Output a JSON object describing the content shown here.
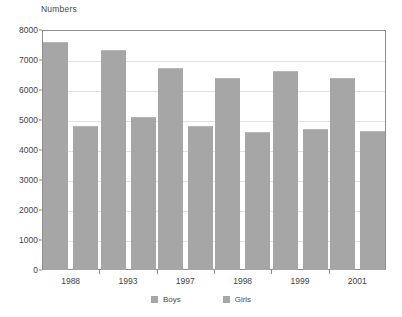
{
  "chart_data": {
    "type": "bar",
    "title": "",
    "ylabel": "Numbers",
    "xlabel": "",
    "categories": [
      "1988",
      "1993",
      "1997",
      "1998",
      "1999",
      "2001"
    ],
    "series": [
      {
        "name": "Boys",
        "color": "#a6a6a6",
        "values": [
          7600,
          7350,
          6750,
          6400,
          6650,
          6400
        ]
      },
      {
        "name": "Girls",
        "color": "#a6a6a6",
        "values": [
          4800,
          5100,
          4800,
          4600,
          4700,
          4650
        ]
      }
    ],
    "ylim": [
      0,
      8000
    ],
    "ytick_values": [
      0,
      1000,
      2000,
      3000,
      4000,
      5000,
      6000,
      7000,
      8000
    ],
    "ytick_labels": [
      "0",
      "1000",
      "2000",
      "3000",
      "4000",
      "5000",
      "6000",
      "7000",
      "8000"
    ],
    "grid": true,
    "legend_position": "bottom",
    "legend_entries": [
      "Boys",
      "Girls"
    ]
  },
  "axis_caption": "Numbers",
  "colors": {
    "bar": "#a6a6a6",
    "grid": "#e2e2e2",
    "frame": "#8e8e8e",
    "text": "#3f3f3f",
    "background": "#ffffff"
  }
}
